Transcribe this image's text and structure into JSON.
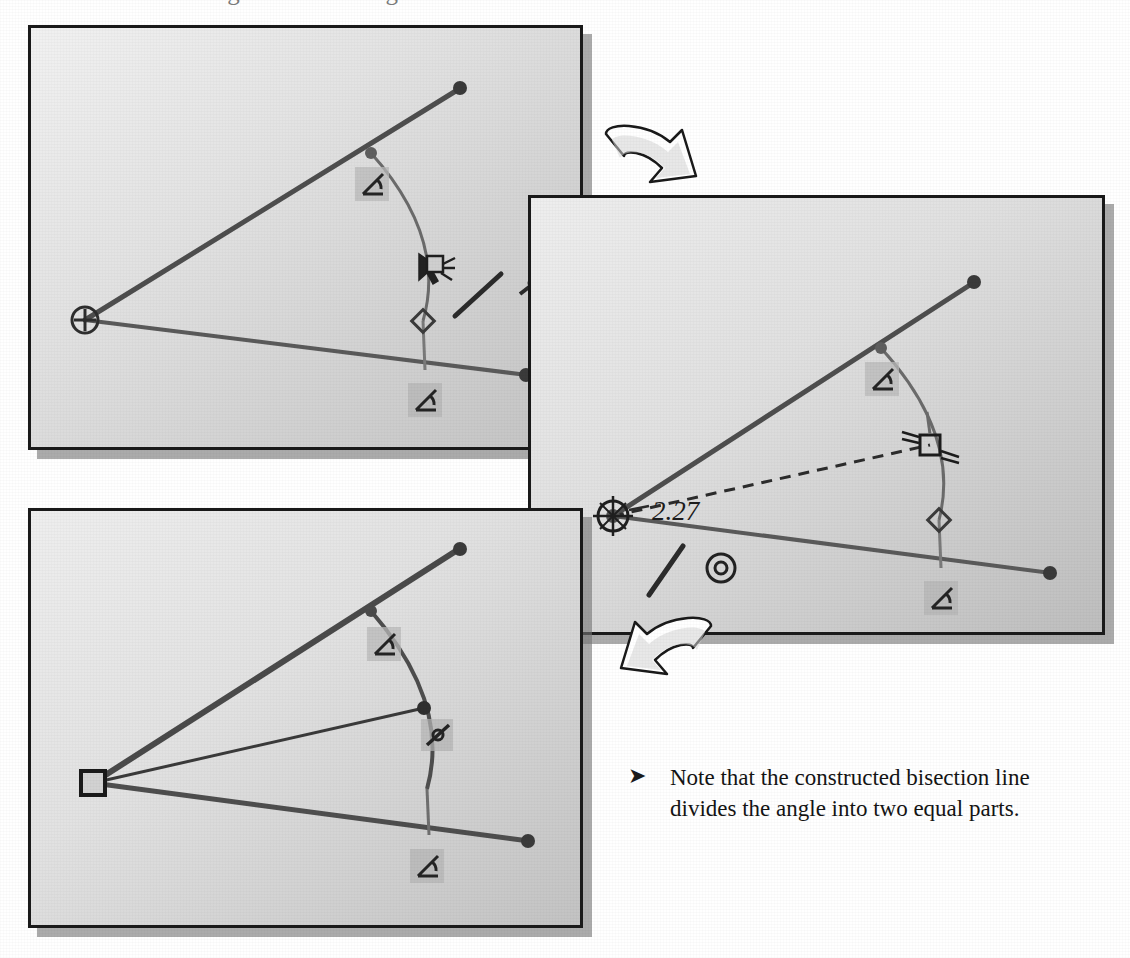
{
  "page": {
    "heading_number": "4.",
    "heading_text": "Create a bisecting line for the angle",
    "background_color": "#ffffff"
  },
  "panels": [
    {
      "id": "panel-1",
      "name": "step-1-screenshot",
      "caption": "Angle with construction arc and line tool active",
      "fill_start_color": "#efefef",
      "fill_end_color": "#c3c3c3",
      "border_color": "#1a1a1a",
      "geometry_color": "#4a4a4a",
      "vertex_marker": "circle-with-cross",
      "markers": [
        "angle-constraint-glyph-upper",
        "angle-constraint-glyph-lower",
        "diamond-handle",
        "endpoint-dot-upper",
        "endpoint-dot-lower"
      ],
      "cursor": "move-cursor-with-drag-icon",
      "tool_glyph": "line-tool-icon"
    },
    {
      "id": "panel-2",
      "name": "step-2-screenshot",
      "caption": "Dashed bisection line being dragged from vertex to arc midpoint, length readout shown",
      "fill_start_color": "#e9e9e9",
      "fill_end_color": "#c0c0c0",
      "border_color": "#1a1a1a",
      "dimension_label": "2.27",
      "vertex_marker": "snap-point-crosshair-circle",
      "markers": [
        "angle-constraint-glyph",
        "diamond-handle",
        "square-handle-on-arc",
        "endpoint-dot-upper",
        "endpoint-dot-lower",
        "concentric-circle-icon"
      ],
      "cursor": "crosshair-cursor",
      "dashed_line": true
    },
    {
      "id": "panel-3",
      "name": "step-3-screenshot",
      "caption": "Completed bisection line dividing the angle into two equal parts",
      "fill_start_color": "#ececec",
      "fill_end_color": "#c5c5c5",
      "border_color": "#1a1a1a",
      "vertex_marker": "square-handle",
      "markers": [
        "angle-constraint-glyph-upper",
        "angle-constraint-glyph-mid",
        "angle-constraint-glyph-lower",
        "endpoint-dot-upper",
        "endpoint-dot-lower",
        "bisection-endpoint-dot"
      ],
      "dashed_line": false
    }
  ],
  "flow_arrows": [
    {
      "name": "flow-arrow-step1-to-step2",
      "direction": "down-right",
      "style": "curved-3d-outline"
    },
    {
      "name": "flow-arrow-step2-to-step3",
      "direction": "down-left",
      "style": "curved-3d-outline"
    }
  ],
  "note": {
    "bullet": "➤",
    "text": "Note that the constructed bisection line divides the angle into two equal parts."
  }
}
